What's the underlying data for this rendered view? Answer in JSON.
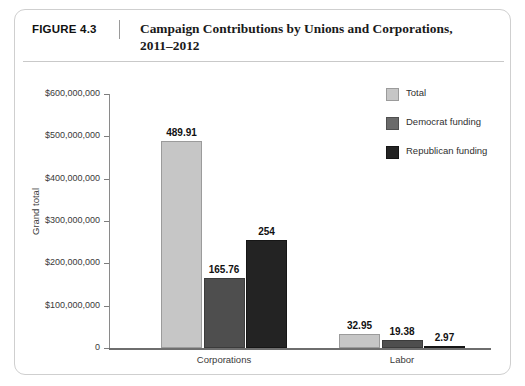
{
  "figure": {
    "number_label": "FIGURE 4.3",
    "title_line1": "Campaign Contributions by Unions and Corporations,",
    "title_line2": "2011–2012"
  },
  "legend": {
    "items": [
      {
        "label": "Total",
        "color": "#c6c6c6"
      },
      {
        "label": "Democrat funding",
        "color": "#6a6a6a"
      },
      {
        "label": "Republican funding",
        "color": "#232323"
      }
    ]
  },
  "axes": {
    "y_title": "Grand total",
    "y_tick_labels": [
      "$600,000,000",
      "$500,000,000",
      "$400,000,000",
      "$300,000,000",
      "$200,000,000",
      "$100,000,000",
      "0"
    ]
  },
  "chart_data": {
    "type": "bar",
    "title": "Campaign Contributions by Unions and Corporations, 2011–2012",
    "xlabel": "",
    "ylabel": "Grand total",
    "ylim": [
      0,
      600000000
    ],
    "yticks": [
      0,
      100000000,
      200000000,
      300000000,
      400000000,
      500000000,
      600000000
    ],
    "ytick_labels": [
      "0",
      "$100,000,000",
      "$200,000,000",
      "$300,000,000",
      "$400,000,000",
      "$500,000,000",
      "$600,000,000"
    ],
    "value_unit": "millions of dollars",
    "grid": false,
    "legend_position": "upper right",
    "categories": [
      "Corporations",
      "Labor"
    ],
    "series": [
      {
        "name": "Total",
        "color": "#c6c6c6",
        "values": [
          489.91,
          32.95
        ],
        "labels": [
          "489.91",
          "32.95"
        ]
      },
      {
        "name": "Democrat funding",
        "color": "#4e4e4e",
        "values": [
          165.76,
          19.38
        ],
        "labels": [
          "165.76",
          "19.38"
        ]
      },
      {
        "name": "Republican funding",
        "color": "#232323",
        "values": [
          254,
          2.97
        ],
        "labels": [
          "254",
          "2.97"
        ]
      }
    ]
  }
}
